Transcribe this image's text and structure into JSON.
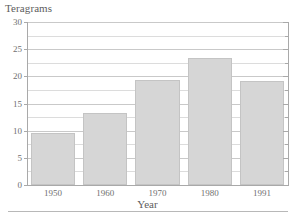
{
  "chart_data": {
    "type": "bar",
    "title": "",
    "ylabel": "Teragrams",
    "xlabel": "Year",
    "categories": [
      "1950",
      "1960",
      "1970",
      "1980",
      "1991"
    ],
    "values": [
      9.5,
      13.3,
      19.3,
      23.4,
      19.1
    ],
    "ylim": [
      0,
      30
    ],
    "y_ticks": [
      "0",
      "5",
      "10",
      "15",
      "20",
      "25",
      "30"
    ],
    "y_tick_values": [
      0,
      5,
      10,
      15,
      20,
      25,
      30
    ],
    "minor_gridline_values": [
      2.5,
      7.5,
      12.5,
      17.5,
      22.5,
      27.5
    ],
    "grid": "horizontal",
    "legend": "none",
    "bar_color": "#d6d6d6",
    "bar_border_color": "#c4c4c4",
    "gridline_color": "#c9c9c9",
    "axis_color": "#a9a9a9",
    "text_color": "#6f6f6f",
    "background": "#ffffff"
  }
}
